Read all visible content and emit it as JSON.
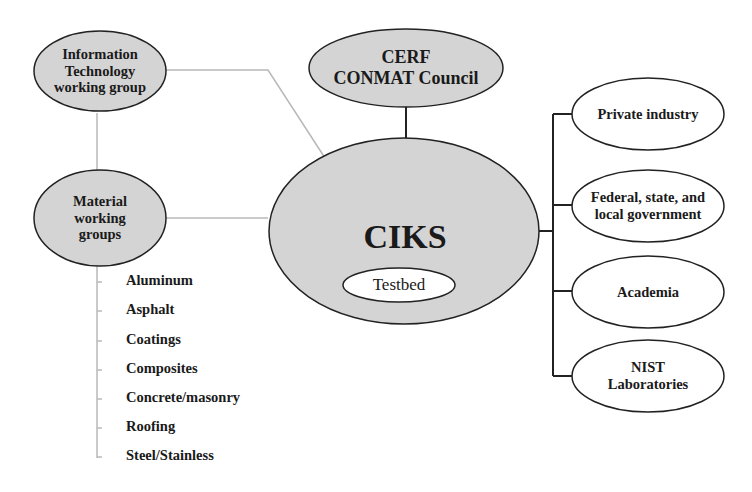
{
  "diagram": {
    "center": {
      "title": "CIKS",
      "inner": "Testbed"
    },
    "top": {
      "label": "CERF\nCONMAT Council"
    },
    "left_nodes": [
      {
        "label": "Information\nTechnology\nworking group"
      },
      {
        "label": "Material\nworking\ngroups"
      }
    ],
    "materials": [
      "Aluminum",
      "Asphalt",
      "Coatings",
      "Composites",
      "Concrete/masonry",
      "Roofing",
      "Steel/Stainless"
    ],
    "right_nodes": [
      {
        "label": "Private industry"
      },
      {
        "label": "Federal, state, and\nlocal government"
      },
      {
        "label": "Academia"
      },
      {
        "label": "NIST\nLaboratories"
      }
    ],
    "colors": {
      "gray_fill": "#d4d4d4",
      "white_fill": "#ffffff",
      "stroke": "#222222",
      "light_connector": "#b8b8b8"
    }
  }
}
